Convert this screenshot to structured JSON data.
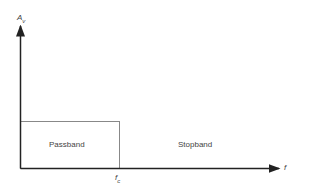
{
  "diagram": {
    "y_axis_label": "A",
    "y_axis_sub": "v",
    "x_axis_label": "f",
    "cutoff_label": "f",
    "cutoff_sub": "c",
    "regions": [
      {
        "name": "passband",
        "label": "Passband"
      },
      {
        "name": "stopband",
        "label": "Stopband"
      }
    ],
    "colors": {
      "axis": "#222222",
      "box": "#888888",
      "text": "#444444"
    }
  }
}
